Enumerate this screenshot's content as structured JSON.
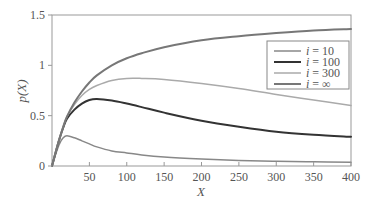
{
  "chart_data": {
    "type": "line",
    "title": "",
    "xlabel": "X",
    "ylabel": "p(X)",
    "xlim": [
      0,
      400
    ],
    "ylim": [
      0,
      1.5
    ],
    "xticks": [
      50,
      100,
      150,
      200,
      250,
      300,
      350,
      400
    ],
    "yticks": [
      0,
      0.5,
      1,
      1.5
    ],
    "ytick_labels": [
      "0",
      "0.5",
      "1",
      "1.5"
    ],
    "grid": false,
    "legend_position": "upper right",
    "x": [
      0,
      5,
      10,
      15,
      20,
      30,
      40,
      50,
      60,
      80,
      100,
      120,
      150,
      200,
      250,
      300,
      350,
      400
    ],
    "series": [
      {
        "name": "i = 10",
        "legend_label": "i = 10",
        "color": "#888888",
        "width": 1.5,
        "values": [
          0,
          0.12,
          0.22,
          0.28,
          0.3,
          0.28,
          0.25,
          0.22,
          0.19,
          0.15,
          0.13,
          0.11,
          0.09,
          0.07,
          0.055,
          0.047,
          0.042,
          0.038
        ]
      },
      {
        "name": "i = 100",
        "legend_label": "i = 100",
        "color": "#333333",
        "width": 2,
        "values": [
          0,
          0.14,
          0.27,
          0.38,
          0.47,
          0.56,
          0.62,
          0.655,
          0.665,
          0.65,
          0.62,
          0.585,
          0.53,
          0.45,
          0.39,
          0.34,
          0.31,
          0.29
        ]
      },
      {
        "name": "i = 300",
        "legend_label": "i = 300",
        "color": "#aaaaaa",
        "width": 1.5,
        "values": [
          0,
          0.14,
          0.27,
          0.39,
          0.49,
          0.61,
          0.7,
          0.76,
          0.8,
          0.85,
          0.87,
          0.87,
          0.86,
          0.82,
          0.77,
          0.71,
          0.655,
          0.6
        ]
      },
      {
        "name": "i = ∞",
        "legend_label": "i = ∞",
        "color": "#777777",
        "width": 2,
        "values": [
          0,
          0.14,
          0.27,
          0.39,
          0.49,
          0.63,
          0.74,
          0.83,
          0.9,
          1.0,
          1.07,
          1.12,
          1.18,
          1.25,
          1.29,
          1.32,
          1.345,
          1.36
        ]
      }
    ]
  }
}
